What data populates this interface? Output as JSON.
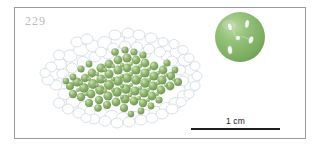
{
  "plate": {
    "figure_number": "229",
    "number_color": "#b9b9bd",
    "frame_color": "#9a9a9e",
    "background": "#ffffff"
  },
  "scale_bar": {
    "label": "1 cm",
    "length_px": 89,
    "line_color": "#1d1d1f"
  },
  "colony": {
    "name": "algal-colony",
    "cell_color": "#87ad64",
    "cell_highlight": "#c4d9ac",
    "cell_shadow": "#6f9550",
    "sheath_outline": "#c3cfd9",
    "sheath_fill": "#ffffff",
    "center_x": 104,
    "center_y": 78,
    "width": 150,
    "height": 86
  },
  "inset_cell": {
    "name": "magnified-cell",
    "fill_color": "#8cba70",
    "edge_color": "#6f9f55",
    "highlight_color": "#b9d7a4",
    "inclusion_color": "#f4f8f0",
    "center_x": 239,
    "center_y": 36,
    "radius": 25,
    "inclusion_count": 5
  }
}
